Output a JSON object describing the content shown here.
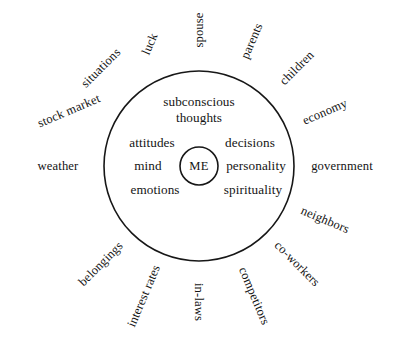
{
  "diagram": {
    "type": "radial-concentric-circle",
    "stroke_color": "#171717",
    "text_color": "#141414",
    "background_color": "#ffffff",
    "geometry": {
      "center_x": 199,
      "center_y": 166,
      "outer_circle_radius": 95,
      "me_circle_radius": 19
    },
    "center": {
      "label": "ME"
    },
    "inner_labels": [
      {
        "id": "subconscious-thoughts",
        "text": "subconscious thoughts",
        "x": 199,
        "y": 110,
        "align": "center"
      },
      {
        "id": "attitudes",
        "text": "attitudes",
        "x": 152,
        "y": 143,
        "align": "center"
      },
      {
        "id": "decisions",
        "text": "decisions",
        "x": 250,
        "y": 143,
        "align": "center"
      },
      {
        "id": "mind",
        "text": "mind",
        "x": 148,
        "y": 166,
        "align": "center"
      },
      {
        "id": "personality",
        "text": "personality",
        "x": 256,
        "y": 166,
        "align": "center"
      },
      {
        "id": "emotions",
        "text": "emotions",
        "x": 155,
        "y": 190,
        "align": "center"
      },
      {
        "id": "spirituality",
        "text": "spirituality",
        "x": 253,
        "y": 190,
        "align": "center"
      }
    ],
    "outer_labels": [
      {
        "id": "spouse",
        "text": "spouse",
        "angle_deg": -90,
        "rotation_deg": -90,
        "radius": 136
      },
      {
        "id": "parents",
        "text": "parents",
        "angle_deg": -67,
        "rotation_deg": -67,
        "radius": 136
      },
      {
        "id": "children",
        "text": "children",
        "angle_deg": -45,
        "rotation_deg": -45,
        "radius": 138
      },
      {
        "id": "economy",
        "text": "economy",
        "angle_deg": -23,
        "rotation_deg": -23,
        "radius": 137
      },
      {
        "id": "government",
        "text": "government",
        "angle_deg": 0,
        "rotation_deg": 0,
        "radius": 143
      },
      {
        "id": "neighbors",
        "text": "neighbors",
        "angle_deg": 23,
        "rotation_deg": 23,
        "radius": 137
      },
      {
        "id": "co-workers",
        "text": "co-workers",
        "angle_deg": 45,
        "rotation_deg": 45,
        "radius": 139
      },
      {
        "id": "competitors",
        "text": "competitors",
        "angle_deg": 67,
        "rotation_deg": 67,
        "radius": 141
      },
      {
        "id": "in-laws",
        "text": "in-laws",
        "angle_deg": 90,
        "rotation_deg": 90,
        "radius": 136
      },
      {
        "id": "interest-rates",
        "text": "interest rates",
        "angle_deg": 113,
        "rotation_deg": -67,
        "radius": 141
      },
      {
        "id": "belongings",
        "text": "belongings",
        "angle_deg": 135,
        "rotation_deg": -45,
        "radius": 139
      },
      {
        "id": "weather",
        "text": "weather",
        "angle_deg": 180,
        "rotation_deg": 0,
        "radius": 141
      },
      {
        "id": "stock-market",
        "text": "stock market",
        "angle_deg": 203,
        "rotation_deg": -23,
        "radius": 141
      },
      {
        "id": "situations",
        "text": "situations",
        "angle_deg": 225,
        "rotation_deg": -45,
        "radius": 138
      },
      {
        "id": "luck",
        "text": "luck",
        "angle_deg": 248,
        "rotation_deg": -67,
        "radius": 132
      }
    ]
  }
}
